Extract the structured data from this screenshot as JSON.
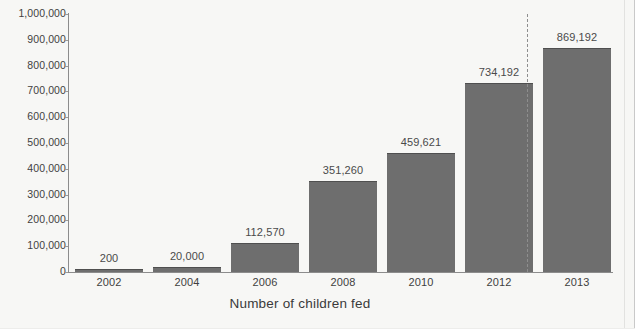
{
  "chart_data": {
    "type": "bar",
    "title": "",
    "xlabel": "Number of children fed",
    "ylabel": "",
    "categories": [
      "2002",
      "2004",
      "2006",
      "2008",
      "2010",
      "2012",
      "2013"
    ],
    "values": [
      200,
      20000,
      112570,
      351260,
      459621,
      734192,
      869192
    ],
    "data_labels": [
      "200",
      "20,000",
      "112,570",
      "351,260",
      "459,621",
      "734,192",
      "869,192"
    ],
    "ylim": [
      0,
      1000000
    ],
    "ytick_values": [
      0,
      100000,
      200000,
      300000,
      400000,
      500000,
      600000,
      700000,
      800000,
      900000,
      1000000
    ],
    "ytick_labels": [
      "0",
      "100,000",
      "200,000",
      "300,000",
      "400,000",
      "500,000",
      "600,000",
      "700,000",
      "800,000",
      "900,000",
      "1,000,000"
    ],
    "grid": false,
    "legend": "none",
    "series_color": "#6e6e6e",
    "background_color": "#f7f7f5",
    "axis_color": "#8c8c8c",
    "label_color": "#4a4a4a",
    "annotations": [
      {
        "name": "projection-divider",
        "type": "vertical-dashed-line",
        "between": [
          "2012",
          "2013"
        ],
        "color": "#8e8e8e"
      }
    ]
  }
}
